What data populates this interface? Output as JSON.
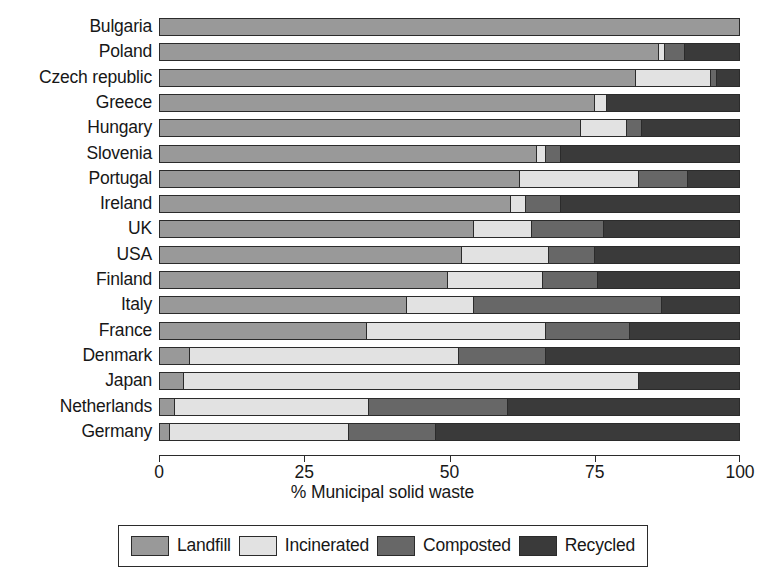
{
  "chart_data": {
    "type": "bar",
    "orientation": "horizontal",
    "stacked": true,
    "title": "",
    "xlabel": "% Municipal solid waste",
    "ylabel": "",
    "xlim": [
      0,
      100
    ],
    "xticks": [
      0,
      25,
      50,
      75,
      100
    ],
    "xticklabels": [
      "0",
      "25",
      "50",
      "75",
      "100"
    ],
    "grid": false,
    "legend_position": "bottom",
    "categories": [
      "Bulgaria",
      "Poland",
      "Czech republic",
      "Greece",
      "Hungary",
      "Slovenia",
      "Portugal",
      "Ireland",
      "UK",
      "USA",
      "Finland",
      "Italy",
      "France",
      "Denmark",
      "Japan",
      "Netherlands",
      "Germany"
    ],
    "series": [
      {
        "name": "Landfill",
        "color": "#999999",
        "values": [
          100,
          86,
          82,
          75,
          72.5,
          65,
          62,
          60.5,
          54,
          52,
          49.5,
          42.5,
          35.5,
          5,
          4,
          2.5,
          1.5
        ]
      },
      {
        "name": "Incinerated",
        "color": "#e2e2e2",
        "values": [
          0,
          1,
          13,
          2,
          8,
          1.5,
          20.5,
          2.5,
          10,
          15,
          16.5,
          11.5,
          31,
          46.5,
          78.5,
          33.5,
          31
        ]
      },
      {
        "name": "Composted",
        "color": "#676767",
        "values": [
          0,
          3.5,
          1,
          0,
          2.5,
          2.5,
          8.5,
          6,
          12.5,
          8,
          9.5,
          32.5,
          14.5,
          15,
          0,
          24,
          15
        ]
      },
      {
        "name": "Recycled",
        "color": "#3a3a3a",
        "values": [
          0,
          9.5,
          4,
          23,
          17,
          31,
          9,
          31,
          23.5,
          25,
          24.5,
          13.5,
          19,
          33.5,
          17.5,
          40,
          52.5
        ]
      }
    ]
  },
  "legend": {
    "items": [
      {
        "label": "Landfill",
        "color": "#999999"
      },
      {
        "label": "Incinerated",
        "color": "#e2e2e2"
      },
      {
        "label": "Composted",
        "color": "#676767"
      },
      {
        "label": "Recycled",
        "color": "#3a3a3a"
      }
    ]
  }
}
